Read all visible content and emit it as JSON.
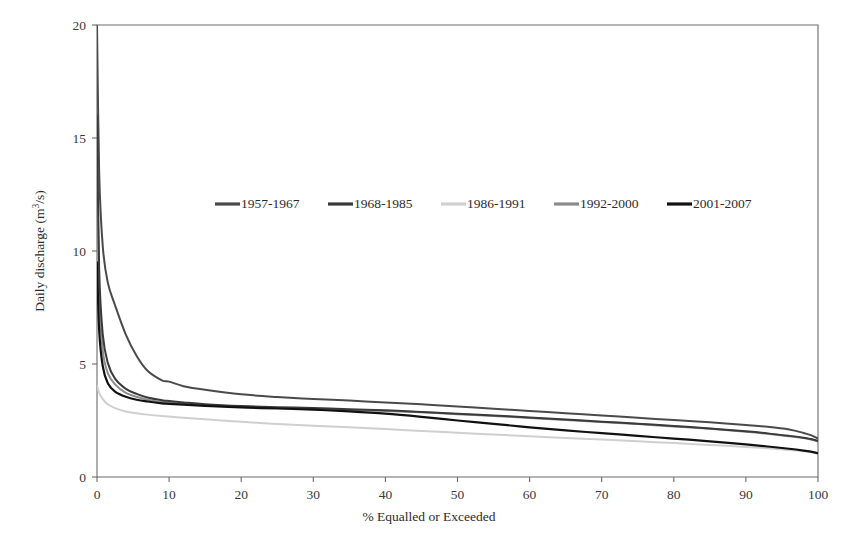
{
  "chart_data": {
    "type": "line",
    "title": "",
    "subtitle": "",
    "xlabel": "% Equalled or Exceeded",
    "ylabel": "Daily discharge (m³/s)",
    "ylabel_parts": {
      "main": "Daily discharge (m",
      "sup": "3",
      "tail": "/s)"
    },
    "xlim": [
      0,
      100
    ],
    "ylim": [
      0,
      20
    ],
    "xticks": [
      0,
      10,
      20,
      30,
      40,
      50,
      60,
      70,
      80,
      90,
      100
    ],
    "xtick_labels": [
      "0",
      "10",
      "20",
      "30",
      "40",
      "50",
      "60",
      "70",
      "80",
      "90",
      "100"
    ],
    "yticks": [
      0,
      5,
      10,
      15,
      20
    ],
    "ytick_labels": [
      "0",
      "5",
      "10",
      "15",
      "20"
    ],
    "grid": false,
    "legend_position": "upper-center-inside",
    "series": [
      {
        "name": "1957-1967",
        "color": "#4a4a4a",
        "width": 2.0,
        "x": [
          0,
          0.3,
          0.8,
          1.5,
          2.5,
          4,
          5.5,
          7,
          9,
          10,
          12,
          15,
          20,
          25,
          30,
          35,
          40,
          45,
          50,
          55,
          60,
          65,
          70,
          75,
          80,
          85,
          90,
          93,
          96,
          98,
          99,
          100
        ],
        "y": [
          20.0,
          13.5,
          10.2,
          8.6,
          7.6,
          6.3,
          5.35,
          4.7,
          4.28,
          4.22,
          4.02,
          3.86,
          3.66,
          3.54,
          3.45,
          3.38,
          3.3,
          3.22,
          3.12,
          3.02,
          2.92,
          2.82,
          2.72,
          2.62,
          2.52,
          2.42,
          2.3,
          2.22,
          2.1,
          1.95,
          1.85,
          1.7
        ]
      },
      {
        "name": "1968-1985",
        "color": "#3a3a3a",
        "width": 2.0,
        "x": [
          0,
          0.3,
          0.8,
          1.5,
          2.5,
          4,
          5.5,
          7,
          9,
          10,
          12,
          15,
          20,
          25,
          30,
          35,
          40,
          45,
          50,
          55,
          60,
          65,
          70,
          75,
          80,
          85,
          90,
          93,
          96,
          98,
          99,
          100
        ],
        "y": [
          16.0,
          9.2,
          6.3,
          5.05,
          4.35,
          3.9,
          3.68,
          3.52,
          3.4,
          3.36,
          3.3,
          3.22,
          3.14,
          3.09,
          3.05,
          3.0,
          2.95,
          2.88,
          2.8,
          2.72,
          2.63,
          2.54,
          2.45,
          2.36,
          2.26,
          2.15,
          2.02,
          1.93,
          1.82,
          1.74,
          1.68,
          1.6
        ]
      },
      {
        "name": "1986-1991",
        "color": "#cfcfcf",
        "width": 2.0,
        "x": [
          0,
          0.3,
          0.8,
          1.5,
          2.5,
          4,
          5.5,
          7,
          9,
          10,
          12,
          15,
          20,
          25,
          30,
          35,
          40,
          45,
          50,
          55,
          60,
          65,
          70,
          75,
          80,
          85,
          90,
          93,
          96,
          98,
          99,
          100
        ],
        "y": [
          4.05,
          3.72,
          3.45,
          3.22,
          3.05,
          2.9,
          2.82,
          2.76,
          2.7,
          2.68,
          2.62,
          2.55,
          2.44,
          2.35,
          2.27,
          2.2,
          2.12,
          2.04,
          1.96,
          1.88,
          1.8,
          1.73,
          1.66,
          1.58,
          1.5,
          1.42,
          1.33,
          1.27,
          1.2,
          1.14,
          1.1,
          1.05
        ]
      },
      {
        "name": "1992-2000",
        "color": "#8c8c8c",
        "width": 2.0,
        "x": [
          0,
          0.3,
          0.8,
          1.5,
          2.5,
          4,
          5.5,
          7,
          9,
          10,
          12,
          15,
          20,
          25,
          30,
          35,
          40,
          45,
          50,
          55,
          60,
          65,
          70,
          75,
          80,
          85,
          90,
          93,
          96,
          98,
          99,
          100
        ],
        "y": [
          14.6,
          8.2,
          5.6,
          4.6,
          4.1,
          3.72,
          3.55,
          3.42,
          3.32,
          3.3,
          3.24,
          3.18,
          3.1,
          3.05,
          3.01,
          2.97,
          2.92,
          2.86,
          2.78,
          2.7,
          2.61,
          2.52,
          2.43,
          2.34,
          2.24,
          2.13,
          2.0,
          1.91,
          1.8,
          1.72,
          1.66,
          1.58
        ]
      },
      {
        "name": "2001-2007",
        "color": "#111111",
        "width": 2.2,
        "x": [
          0,
          0.3,
          0.8,
          1.5,
          2.5,
          4,
          5.5,
          7,
          9,
          10,
          12,
          15,
          20,
          25,
          30,
          35,
          40,
          45,
          50,
          55,
          60,
          65,
          70,
          75,
          80,
          85,
          90,
          93,
          96,
          98,
          99,
          100
        ],
        "y": [
          9.5,
          6.5,
          4.9,
          4.15,
          3.78,
          3.55,
          3.42,
          3.34,
          3.26,
          3.24,
          3.2,
          3.15,
          3.08,
          3.03,
          2.98,
          2.9,
          2.8,
          2.66,
          2.5,
          2.35,
          2.2,
          2.06,
          1.94,
          1.82,
          1.7,
          1.58,
          1.44,
          1.35,
          1.25,
          1.17,
          1.12,
          1.05
        ]
      }
    ]
  },
  "legend": {
    "entries": [
      {
        "label": "1957-1967",
        "color": "#4a4a4a"
      },
      {
        "label": "1968-1985",
        "color": "#3a3a3a"
      },
      {
        "label": "1986-1991",
        "color": "#cfcfcf"
      },
      {
        "label": "1992-2000",
        "color": "#8c8c8c"
      },
      {
        "label": "2001-2007",
        "color": "#111111"
      }
    ]
  },
  "plot_geometry": {
    "left": 97,
    "right": 818,
    "top": 25,
    "bottom": 477
  }
}
